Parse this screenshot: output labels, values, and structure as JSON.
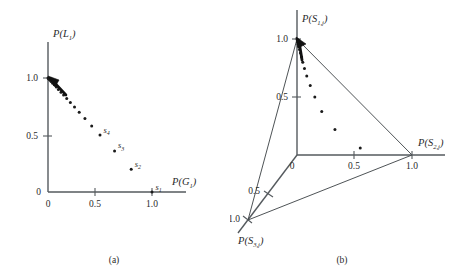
{
  "figure": {
    "background": "#ffffff",
    "ink": "#2a2a2a",
    "panels": [
      {
        "id": "panel-a",
        "caption": "(a)",
        "type": "scatter",
        "xlabel_main": "P(G",
        "xlabel_sub": "1",
        "xlabel_close": ")",
        "ylabel_main": "P(L",
        "ylabel_sub": "1",
        "ylabel_close": ")",
        "x_ticks": [
          "0",
          "0.5",
          "1.0"
        ],
        "y_ticks": [
          "0",
          "0.5",
          "1.0"
        ],
        "origin_label": "0"
      },
      {
        "id": "panel-b",
        "caption": "(b)",
        "type": "scatter",
        "label_s1_main": "P(S",
        "label_s1_sub": "1,j",
        "label_s1_close": ")",
        "label_s2_main": "P(S",
        "label_s2_sub": "2,j",
        "label_s2_close": ")",
        "label_s3_main": "P(S",
        "label_s3_sub": "3,j",
        "label_s3_close": ")",
        "x_ticks": [
          "0",
          "0.5",
          "1.0"
        ],
        "y_ticks": [
          "0.5",
          "1.0"
        ],
        "z_ticks": [
          "0.5",
          "1.0"
        ],
        "origin_label": "0"
      }
    ]
  },
  "point_labels_a": [
    {
      "name": "s",
      "sub": "1"
    },
    {
      "name": "s",
      "sub": "2"
    },
    {
      "name": "s",
      "sub": "3"
    },
    {
      "name": "s",
      "sub": "4"
    }
  ],
  "chart_data": [
    {
      "type": "scatter",
      "title": "(a)",
      "xlabel": "P(G_1)",
      "ylabel": "P(L_1)",
      "xlim": [
        0,
        1.15
      ],
      "ylim": [
        0,
        1.15
      ],
      "xticks": [
        0,
        0.5,
        1.0
      ],
      "yticks": [
        0,
        0.5,
        1.0
      ],
      "grid": false,
      "legend": "none",
      "annotations": [
        "arrow at (0,1.0) pointing up-left toward convergence vertex"
      ],
      "series": [
        {
          "name": "trajectory",
          "x": [
            1.0,
            0.8,
            0.64,
            0.5,
            0.42,
            0.355,
            0.3,
            0.255,
            0.215,
            0.18,
            0.15,
            0.125,
            0.1,
            0.08,
            0.06,
            0.045,
            0.03,
            0.02,
            0.012,
            0.006,
            0.0
          ],
          "y": [
            0.0,
            0.2,
            0.36,
            0.5,
            0.58,
            0.645,
            0.7,
            0.745,
            0.785,
            0.82,
            0.85,
            0.875,
            0.9,
            0.92,
            0.94,
            0.955,
            0.97,
            0.98,
            0.988,
            0.994,
            1.0
          ]
        }
      ],
      "labeled_points": [
        {
          "label": "s_1",
          "x": 1.0,
          "y": 0.0
        },
        {
          "label": "s_2",
          "x": 0.8,
          "y": 0.2
        },
        {
          "label": "s_3",
          "x": 0.64,
          "y": 0.36
        },
        {
          "label": "s_4",
          "x": 0.5,
          "y": 0.5
        }
      ]
    },
    {
      "type": "scatter",
      "title": "(b)",
      "xlabel": "P(S_2,j)",
      "ylabel": "P(S_1,j)",
      "zlabel": "P(S_3,j)",
      "xlim": [
        0,
        1.15
      ],
      "ylim": [
        0,
        1.15
      ],
      "zlim": [
        0,
        1.15
      ],
      "xticks": [
        0,
        0.5,
        1.0
      ],
      "yticks": [
        0.5,
        1.0
      ],
      "zticks": [
        0.5,
        1.0
      ],
      "grid": false,
      "legend": "none",
      "annotations": [
        "simplex triangle connecting unit points on the three axes",
        "arrow at P(S_1,j)=1.0 vertex"
      ],
      "series": [
        {
          "name": "trajectory",
          "x": [
            0.55,
            0.33,
            0.215,
            0.155,
            0.115,
            0.085,
            0.065,
            0.05,
            0.04,
            0.03,
            0.022,
            0.016,
            0.011,
            0.007,
            0.004,
            0.0
          ],
          "y": [
            0.06,
            0.22,
            0.375,
            0.5,
            0.6,
            0.68,
            0.745,
            0.8,
            0.845,
            0.88,
            0.91,
            0.935,
            0.955,
            0.972,
            0.986,
            1.0
          ]
        }
      ]
    }
  ]
}
